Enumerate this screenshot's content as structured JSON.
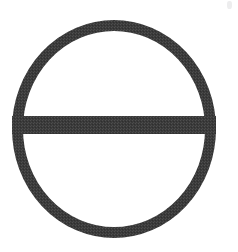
{
  "image": {
    "kind": "scanned-line-drawing",
    "caption": "Circle bisected by a horizontal diameter line",
    "alt_text": "A thick dark outlined circle with a horizontal bar across its middle",
    "background_color": "#ffffff",
    "stroke_color": "#3a3a3a",
    "stroke_color_light": "#4a4a4a",
    "canvas_width": 238,
    "canvas_height": 252
  },
  "figure": {
    "name": "circle-with-horizontal-diameter",
    "circle": {
      "center_x": 114,
      "center_y": 129,
      "outer_left": 12,
      "outer_right": 216,
      "outer_top": 20,
      "outer_bottom": 238,
      "radius_x": 102,
      "radius_y": 109,
      "stroke_width": 11
    },
    "horizontal_bar": {
      "x_start": 12,
      "x_end": 216,
      "y_top": 116,
      "y_bottom": 134,
      "thickness": 18,
      "center_y": 125
    }
  },
  "artifacts": {
    "corner_speck": {
      "label": "scan-speck",
      "x": 227,
      "y": 1,
      "width": 5,
      "height": 8,
      "color": "#ececed"
    }
  }
}
